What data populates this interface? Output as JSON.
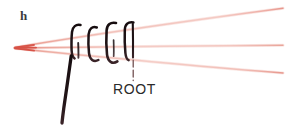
{
  "figure": {
    "panel_label": "h",
    "root_label": "ROOT",
    "background_color": "#ffffff",
    "ink_color": "#1a1012",
    "guide_line_color": "#e8897f",
    "guide_line_core_color": "#d9564b",
    "pointer_color": "#8c5a5a"
  },
  "annotations": {
    "panel_letter": {
      "text": "h",
      "x": 20,
      "y": 9
    },
    "root_callout": {
      "text": "ROOT",
      "x": 113,
      "y": 82,
      "pointer_from_x": 133,
      "pointer_from_y": 58,
      "pointer_to_x": 133,
      "pointer_to_y": 80
    }
  },
  "guide_lines": {
    "count": 3,
    "convergence_x": 15,
    "convergence_y": 47,
    "color": "#e8897f",
    "endpoints": [
      {
        "name": "upper-guide-line",
        "x": 283,
        "y": 8
      },
      {
        "name": "middle-guide-line",
        "x": 283,
        "y": 45
      },
      {
        "name": "lower-guide-line",
        "x": 283,
        "y": 73
      }
    ]
  },
  "strokes": {
    "hook_count": 4,
    "hook_positions_x": [
      72,
      90,
      108,
      126
    ],
    "long_stroke": {
      "name": "descending-stroke",
      "from_x": 71,
      "from_y": 56,
      "to_x": 62,
      "to_y": 123
    }
  }
}
